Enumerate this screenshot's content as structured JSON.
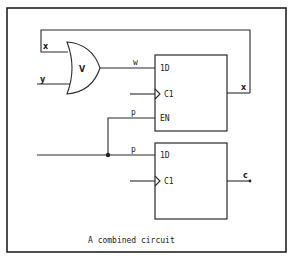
{
  "diagram": {
    "caption": "A combined circuit",
    "or_gate": {
      "symbol": "V",
      "inputs": [
        "x",
        "y"
      ],
      "output": "w"
    },
    "flip_flop_top": {
      "pins": [
        "1D",
        "C1",
        "EN"
      ],
      "output": "x"
    },
    "flip_flop_bottom": {
      "pins": [
        "1D",
        "C1"
      ],
      "output": "c"
    },
    "signals": {
      "x_in": "x",
      "y_in": "y",
      "w": "w",
      "p_top": "p",
      "p_bottom": "p",
      "x_out": "x",
      "c_out": "c"
    }
  }
}
